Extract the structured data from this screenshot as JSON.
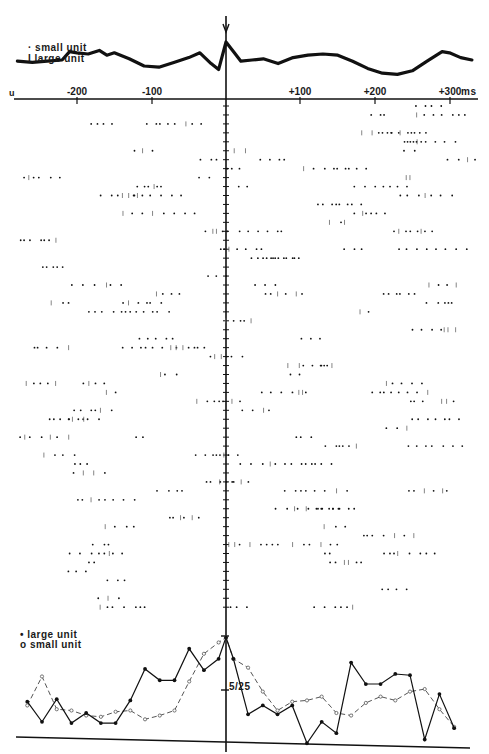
{
  "figure": {
    "legend_top": {
      "small_unit": "· small unit",
      "large_unit": "I large unit"
    },
    "legend_bottom": {
      "large_unit": "• large unit",
      "small_unit": "o small unit"
    },
    "x_axis": {
      "origin_label": "u",
      "ticks": [
        {
          "value": -200,
          "label": "-200",
          "x": 77
        },
        {
          "value": -100,
          "label": "-100",
          "x": 152
        },
        {
          "value": 100,
          "label": "+100",
          "x": 300
        },
        {
          "value": 200,
          "label": "+200",
          "x": 375
        },
        {
          "value": 300,
          "label": "+300",
          "x": 450
        }
      ],
      "unit": "ms"
    },
    "histogram_scale_label": "5/25",
    "colors": {
      "ink": "#111111",
      "background": "#ffffff",
      "dashed": "#555555"
    }
  },
  "chart_data": [
    {
      "type": "line",
      "title": "Averaged waveform (trigger at 0 ms, arrow)",
      "xlabel": "ms",
      "xlim": [
        -280,
        330
      ],
      "x": [
        -280,
        -260,
        -240,
        -220,
        -210,
        -200,
        -185,
        -170,
        -160,
        -150,
        -130,
        -110,
        -90,
        -70,
        -50,
        -35,
        -20,
        -10,
        0,
        10,
        20,
        35,
        50,
        70,
        90,
        110,
        130,
        150,
        170,
        190,
        210,
        230,
        250,
        270,
        290,
        300,
        315,
        330
      ],
      "values": [
        0.2,
        0.15,
        0.2,
        0.25,
        0.6,
        0.55,
        0.5,
        0.65,
        0.45,
        0.55,
        0.3,
        0.0,
        -0.05,
        0.15,
        0.35,
        0.55,
        0.1,
        -0.15,
        1.0,
        0.6,
        0.2,
        0.25,
        0.3,
        0.1,
        0.35,
        0.45,
        0.5,
        0.45,
        0.2,
        -0.1,
        -0.3,
        -0.35,
        -0.2,
        0.2,
        0.6,
        0.55,
        0.35,
        0.25
      ],
      "annotations": [
        "arrow at 0 ms"
      ]
    },
    {
      "type": "scatter",
      "title": "Raster: spike times per trial (dots = small unit, ticks = large unit)",
      "xlabel": "ms",
      "xlim": [
        -280,
        330
      ],
      "trials": 57,
      "note": "Dense raster of ~57 sweeps; dot/tick events aligned to 0 ms vertical axis"
    },
    {
      "type": "line",
      "title": "Peri-event histogram",
      "xlabel": "ms",
      "ylabel": "",
      "y_scale_label": "5/25",
      "series": [
        {
          "name": "large unit",
          "style": "solid, filled circles",
          "x": [
            -270,
            -250,
            -230,
            -210,
            -190,
            -170,
            -150,
            -130,
            -110,
            -90,
            -70,
            -50,
            -30,
            -10,
            0,
            10,
            30,
            50,
            70,
            90,
            110,
            130,
            150,
            170,
            190,
            210,
            230,
            250,
            270,
            290,
            310
          ],
          "values": [
            3.2,
            1.6,
            3.4,
            1.5,
            2.3,
            1.5,
            1.5,
            3.3,
            5.8,
            4.9,
            4.9,
            7.4,
            5.7,
            6.6,
            8.3,
            6.6,
            2.2,
            2.9,
            2.2,
            2.9,
            -0.1,
            1.6,
            0.7,
            6.3,
            4.6,
            4.6,
            5.4,
            5.3,
            0.2,
            3.8,
            1.1
          ]
        },
        {
          "name": "small unit",
          "style": "dashed, open circles",
          "x": [
            -270,
            -250,
            -230,
            -210,
            -190,
            -170,
            -150,
            -130,
            -110,
            -90,
            -70,
            -50,
            -30,
            -10,
            0,
            10,
            30,
            50,
            70,
            90,
            110,
            130,
            150,
            170,
            190,
            210,
            230,
            250,
            270,
            290,
            310
          ],
          "values": [
            2.9,
            5.2,
            2.6,
            2.5,
            2.1,
            2.0,
            2.4,
            2.5,
            1.8,
            2.1,
            2.5,
            4.8,
            7.0,
            7.9,
            8.3,
            6.6,
            5.9,
            4.0,
            2.5,
            3.2,
            3.3,
            3.6,
            2.3,
            2.1,
            3.1,
            3.6,
            3.3,
            4.0,
            4.2,
            2.6,
            1.2
          ]
        }
      ]
    }
  ]
}
